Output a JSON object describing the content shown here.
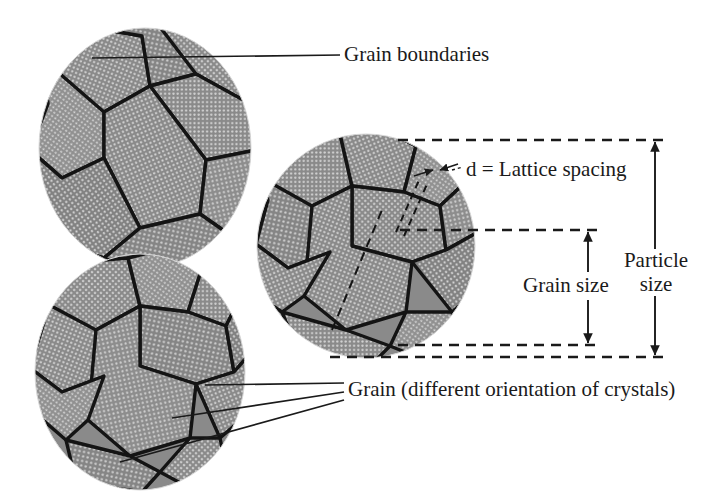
{
  "figure": {
    "background_color": "#ffffff",
    "ink_color": "#1a1a1a",
    "lattice_fill_color": "#8a8a8a",
    "lattice_dot_color": "#cfcfcf",
    "grain_boundary_color": "#141414"
  },
  "labels": {
    "grain_boundaries": "Grain boundaries",
    "lattice_spacing": "d = Lattice spacing",
    "particle_size_line1": "Particle",
    "particle_size_line2": "size",
    "grain_size": "Grain size",
    "grain_orientation": "Grain (different orientation of crystals)"
  },
  "particles": [
    {
      "name": "top-left-particle",
      "cx": 145,
      "cy": 148,
      "rx": 106,
      "ry": 120
    },
    {
      "name": "middle-right-particle",
      "cx": 366,
      "cy": 246,
      "rx": 109,
      "ry": 112
    },
    {
      "name": "bottom-left-particle",
      "cx": 140,
      "cy": 372,
      "rx": 105,
      "ry": 118
    }
  ],
  "dimensions": [
    {
      "name": "particle-size-dimension",
      "label": "Particle size",
      "x": 655,
      "y_top": 140,
      "y_bottom": 357
    },
    {
      "name": "grain-size-dimension",
      "label": "Grain size",
      "x": 588,
      "y_top": 230,
      "y_bottom": 345
    }
  ],
  "guide_lines": [
    {
      "name": "particle-top-guide",
      "y": 140,
      "x_start": 398,
      "x_end": 668
    },
    {
      "name": "grain-top-guide",
      "y": 230,
      "x_start": 400,
      "x_end": 600
    },
    {
      "name": "grain-bottom-guide",
      "y": 345,
      "x_start": 398,
      "x_end": 600
    },
    {
      "name": "particle-bottom-guide",
      "y": 357,
      "x_start": 330,
      "x_end": 668
    }
  ]
}
